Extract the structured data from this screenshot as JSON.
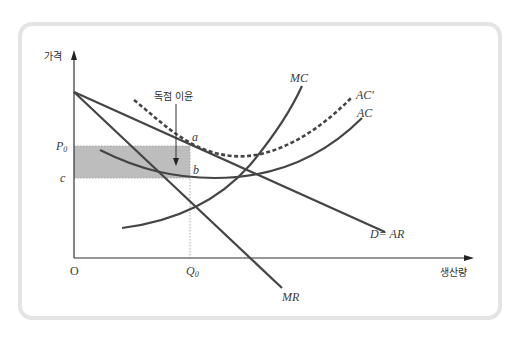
{
  "axes": {
    "y_label": "가격",
    "x_label": "생산량",
    "origin": "O"
  },
  "annotation": {
    "monopoly_profit": "독점 이윤"
  },
  "ticks": {
    "p0_main": "P",
    "p0_sub": "0",
    "c": "c",
    "q0_main": "Q",
    "q0_sub": "0"
  },
  "points": {
    "a": "a",
    "b": "b"
  },
  "curves": {
    "mc": "MC",
    "ac_prime": "AC′",
    "ac": "AC",
    "demand": "D= AR",
    "mr": "MR"
  },
  "colors": {
    "curve": "#454545",
    "shaded_area": "#bdbdbd",
    "frame_border": "#e4e4e4",
    "guide_line": "#a8a8a8"
  }
}
